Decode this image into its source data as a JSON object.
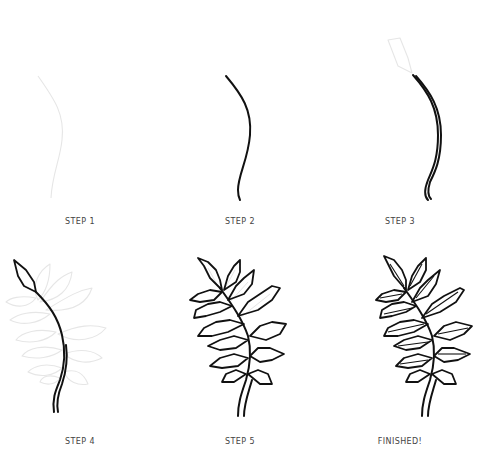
{
  "steps": [
    {
      "label": "STEP 1"
    },
    {
      "label": "STEP 2"
    },
    {
      "label": "STEP 3"
    },
    {
      "label": "STEP 4"
    },
    {
      "label": "STEP 5"
    },
    {
      "label": "FINISHED!"
    }
  ],
  "colors": {
    "ink": "#111111",
    "guide": "#e6e6e6",
    "label": "#444444",
    "background": "#ffffff"
  }
}
